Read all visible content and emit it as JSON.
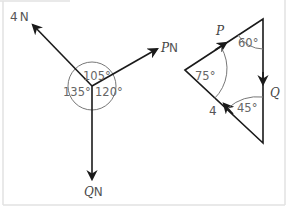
{
  "figure": {
    "left_diagram": {
      "forces": [
        {
          "magnitude": "4",
          "unit": "N",
          "direction": "up-left"
        },
        {
          "magnitude": "P",
          "unit": "N",
          "direction": "up-right"
        },
        {
          "magnitude": "Q",
          "unit": "N",
          "direction": "down"
        }
      ],
      "angles": [
        "105°",
        "135°",
        "120°"
      ]
    },
    "right_diagram": {
      "type": "triangle of forces",
      "side_labels": {
        "p": "P",
        "q": "Q",
        "four": "4"
      },
      "angles": [
        "60°",
        "75°",
        "45°"
      ]
    },
    "colors": {
      "line": "#1a1a1a",
      "arc": "#777777",
      "text": "#555555",
      "frame": "#e2e2e2"
    }
  }
}
